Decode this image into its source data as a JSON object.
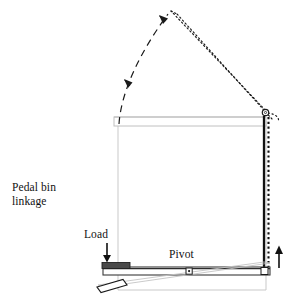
{
  "figure": {
    "kind": "mechanism-diagram",
    "background_color": "#ffffff",
    "width": 294,
    "height": 304
  },
  "labels": {
    "title_line1": "Pedal bin",
    "title_line2": "linkage",
    "load": "Load",
    "pivot": "Pivot"
  },
  "colors": {
    "ink": "#111111",
    "bin_outline": "#c9c9c9",
    "lid_outline": "#bdbdbd",
    "lever_outline": "#3a3a3a",
    "rod_solid": "#111111",
    "rod_dotted": "#111111",
    "pedal_fill": "#ffffff",
    "load_block_fill": "#4a4a4a"
  },
  "parts": [
    {
      "name": "bin-body",
      "note": "open-topped rectangular bin outline, light grey"
    },
    {
      "name": "lid-closed",
      "note": "thin horizontal lid resting on bin top"
    },
    {
      "name": "lid-open",
      "note": "dotted outline of lid raised to open position"
    },
    {
      "name": "hinge-pin",
      "note": "small circle at top right where lid hinges"
    },
    {
      "name": "vertical-rod",
      "note": "solid black rod from lever right end up to lid hinge"
    },
    {
      "name": "vertical-rod-moved",
      "note": "dotted rod showing lifted position"
    },
    {
      "name": "lever-arm",
      "note": "long horizontal lever spanning bin base"
    },
    {
      "name": "lever-arm-moved",
      "note": "thin outline of lever in depressed position"
    },
    {
      "name": "pivot-pin",
      "note": "small square fulcrum near centre of lever"
    },
    {
      "name": "load-block",
      "note": "dark block at left end of lever where foot presses"
    },
    {
      "name": "pedal",
      "note": "small parallelogram pedal below left end"
    },
    {
      "name": "load-arrow",
      "note": "downward arrow above load block"
    },
    {
      "name": "lift-arrow",
      "note": "upward arrow at right of rod"
    },
    {
      "name": "motion-arc",
      "note": "dashed arc with two arrowheads showing lid swinging open"
    }
  ]
}
